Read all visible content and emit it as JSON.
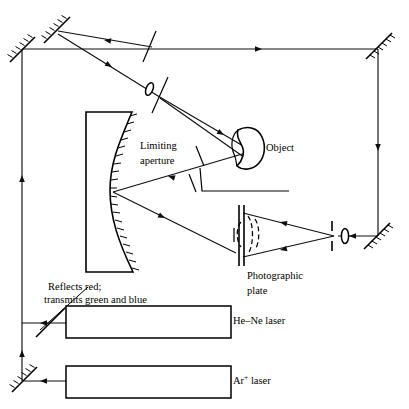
{
  "figure": {
    "type": "optical-ray-diagram",
    "background_color": "#ffffff",
    "line_color": "#000000"
  },
  "labels": {
    "object": "Object",
    "limiting_aperture_line1": "Limiting",
    "limiting_aperture_line2": "aperture",
    "photographic_plate_line1": "Photographic",
    "photographic_plate_line2": "plate",
    "beamsplitter_note_line1": "Reflects red;",
    "beamsplitter_note_line2": "transmits green and blue",
    "hene_laser": "He–Ne laser",
    "ar_laser_base": "Ar",
    "ar_laser_sup": "+",
    "ar_laser_tail": " laser"
  },
  "components": [
    {
      "id": "mirror-top-left-upper",
      "name": "plane-mirror",
      "angle_deg": 45,
      "x": 56,
      "y": 27
    },
    {
      "id": "mirror-left-edge",
      "name": "plane-mirror",
      "angle_deg": 45,
      "x": 22,
      "y": 49
    },
    {
      "id": "mirror-top-right",
      "name": "plane-mirror",
      "angle_deg": 45,
      "x": 378,
      "y": 45
    },
    {
      "id": "mirror-bottom-right",
      "name": "plane-mirror",
      "angle_deg": 45,
      "x": 377,
      "y": 236
    },
    {
      "id": "mirror-bottom-left",
      "name": "plane-mirror",
      "angle_deg": 45,
      "x": 24,
      "y": 380
    },
    {
      "id": "beamsplitter-dichroic",
      "name": "dichroic-beamsplitter",
      "angle_deg": 45,
      "x": 50,
      "y": 323
    },
    {
      "id": "beamsplitter-top",
      "name": "beamsplitter",
      "angle_deg": 70,
      "x": 149,
      "y": 47
    },
    {
      "id": "beamsplitter-mid",
      "name": "beamsplitter",
      "angle_deg": 70,
      "x": 160,
      "y": 95
    },
    {
      "id": "lens-object-beam",
      "name": "lens",
      "x": 150,
      "y": 89
    },
    {
      "id": "lens-reference-beam",
      "name": "lens",
      "x": 345,
      "y": 234
    },
    {
      "id": "spatial-filter",
      "name": "pinhole-aperture",
      "x": 332,
      "y": 234
    },
    {
      "id": "concave-mirror",
      "name": "concave-mirror",
      "x": 100,
      "y": 190
    },
    {
      "id": "photographic-plate",
      "name": "photographic-plate",
      "x": 242,
      "y": 235
    },
    {
      "id": "object",
      "name": "object",
      "x": 255,
      "y": 148
    },
    {
      "id": "limiting-aperture",
      "name": "limiting-aperture",
      "x": 200,
      "y": 165
    },
    {
      "id": "hene-laser",
      "name": "laser-source",
      "x": 148,
      "y": 322
    },
    {
      "id": "ar-laser",
      "name": "laser-source",
      "x": 148,
      "y": 382
    }
  ],
  "beams": {
    "count": 2,
    "description_red": "He–Ne (red) reflected by dichroic beamsplitter",
    "description_bluegreen": "Ar+ (green/blue) transmitted by dichroic beamsplitter"
  }
}
